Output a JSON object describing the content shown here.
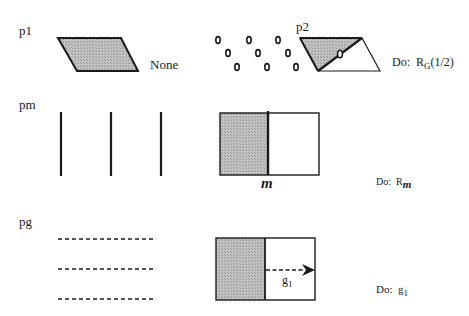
{
  "rows": [
    {
      "id": "p1",
      "group_label": "p1",
      "caption": "None",
      "action": null
    },
    {
      "id": "p2",
      "group_label": "p2",
      "action": {
        "prefix": "Do:",
        "symbol": "R",
        "subscript": "G",
        "suffix": "(1/2)"
      }
    },
    {
      "id": "pm",
      "group_label": "pm",
      "mirror_label": "m",
      "action": {
        "prefix": "Do:",
        "symbol": "R",
        "subscript": "m",
        "suffix": ""
      }
    },
    {
      "id": "pg",
      "group_label": "pg",
      "glide_label": "g",
      "glide_subscript": "1",
      "action": {
        "prefix": "Do:",
        "symbol": "g",
        "subscript": "1",
        "suffix": ""
      }
    }
  ],
  "colors": {
    "shade": "#b8b8b8",
    "stroke": "#1a1a1a",
    "background": "#ffffff"
  }
}
